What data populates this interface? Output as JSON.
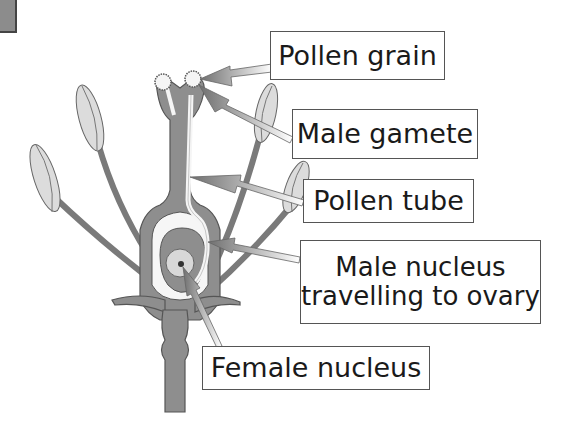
{
  "labels": {
    "pollen_grain": "Pollen grain",
    "male_gamete": "Male gamete",
    "pollen_tube": "Pollen tube",
    "male_nucleus_line1": "Male nucleus",
    "male_nucleus_line2": "travelling to ovary",
    "female_nucleus": "Female nucleus"
  },
  "colors": {
    "carpel_fill": "#8e8e8e",
    "carpel_stroke": "#555555",
    "anther_fill": "#d6d6d6",
    "tube_fill": "#f5f5f5",
    "arrow_fill": "#777777",
    "box_border": "#555555",
    "text": "#1a1a1a"
  }
}
